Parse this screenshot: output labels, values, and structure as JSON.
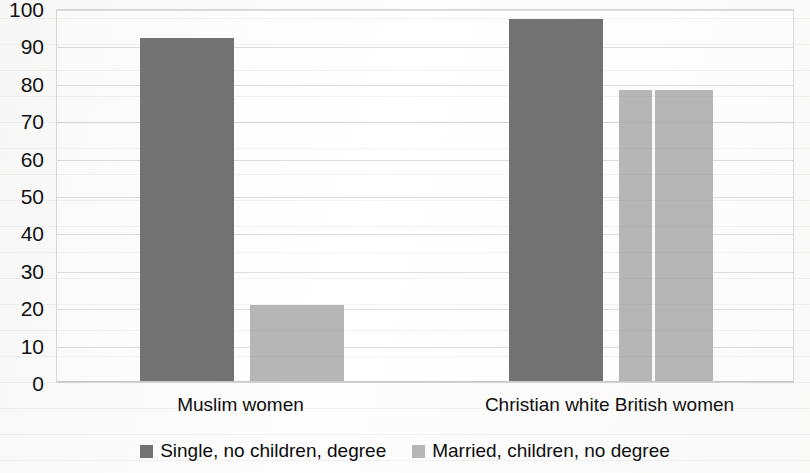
{
  "chart_data": {
    "type": "bar",
    "title": "",
    "subtitle": "",
    "xlabel": "",
    "ylabel": "",
    "ylim": [
      0,
      100
    ],
    "y_ticks": [
      0,
      10,
      20,
      30,
      40,
      50,
      60,
      70,
      80,
      90,
      100
    ],
    "grid": true,
    "legend_position": "bottom",
    "categories": [
      "Muslim women",
      "Christian white British women"
    ],
    "series": [
      {
        "name": "Single, no children, degree",
        "color": "#717171",
        "values": [
          92,
          97
        ]
      },
      {
        "name": "Married, children, no degree",
        "color": "#b6b6b6",
        "values": [
          20.5,
          78
        ]
      }
    ]
  },
  "axes": {
    "y_tick_labels": [
      "100",
      "90",
      "80",
      "70",
      "60",
      "50",
      "40",
      "30",
      "20",
      "10",
      "0"
    ]
  },
  "legend": {
    "items": [
      {
        "label": "Single, no children, degree",
        "swatch": "series-a"
      },
      {
        "label": "Married, children, no degree",
        "swatch": "series-b"
      }
    ]
  },
  "colors": {
    "series_a": "#717171",
    "series_b": "#b6b6b6",
    "gridline": "#dedede",
    "text": "#0b0b0b",
    "background": "#ffffff"
  }
}
